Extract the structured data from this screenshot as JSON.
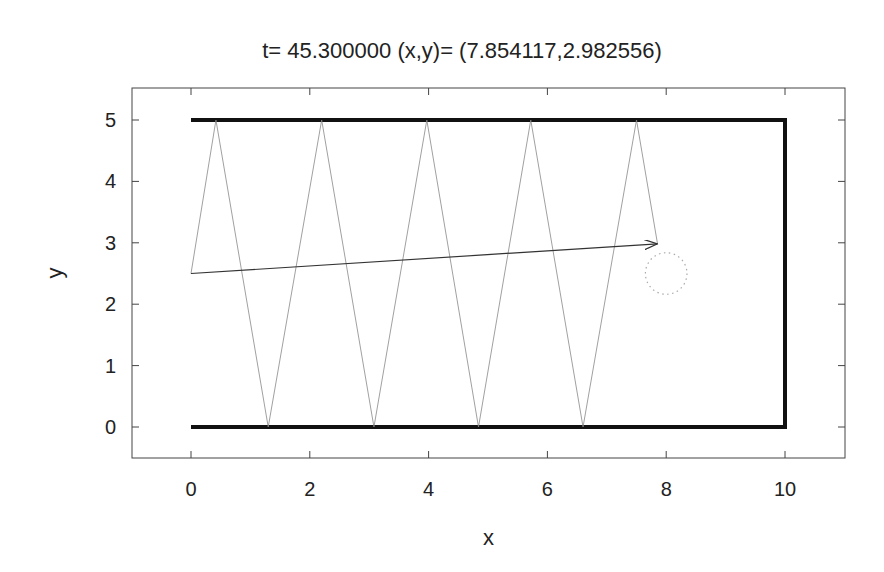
{
  "chart_data": {
    "type": "line",
    "title": "t= 45.300000 (x,y)= (7.854117,2.982556)",
    "xlabel": "x",
    "ylabel": "y",
    "xlim": [
      -1,
      11
    ],
    "ylim": [
      -0.5,
      5.5
    ],
    "xticks": [
      0,
      2,
      4,
      6,
      8,
      10
    ],
    "yticks": [
      0,
      1,
      2,
      3,
      4,
      5
    ],
    "grid": false,
    "legend": null,
    "series": [
      {
        "name": "walls",
        "style": "thick-black",
        "x": [
          0,
          10,
          10,
          0
        ],
        "y": [
          5,
          5,
          0,
          0
        ]
      },
      {
        "name": "trajectory",
        "style": "thin-gray",
        "x": [
          0,
          0.42,
          1.3,
          2.2,
          3.08,
          3.97,
          4.84,
          5.72,
          6.6,
          7.5,
          7.854
        ],
        "y": [
          2.5,
          5,
          0,
          5,
          0,
          5,
          0,
          5,
          0,
          5,
          2.983
        ]
      },
      {
        "name": "displacement-arrow",
        "style": "arrow",
        "x": [
          0,
          7.854
        ],
        "y": [
          2.5,
          2.983
        ]
      },
      {
        "name": "circle",
        "style": "dotted",
        "center": [
          8,
          2.5
        ],
        "radius": 0.35
      }
    ]
  }
}
